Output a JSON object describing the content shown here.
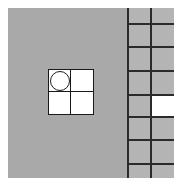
{
  "board": {
    "background": "#a9a9a9",
    "panel_background": "#b4b4b4",
    "line_color": "#2a2a2a"
  },
  "active_piece": {
    "cells": [
      {
        "row": 0,
        "col": 0,
        "has_circle": true
      },
      {
        "row": 0,
        "col": 1,
        "has_circle": false
      },
      {
        "row": 1,
        "col": 0,
        "has_circle": false
      },
      {
        "row": 1,
        "col": 1,
        "has_circle": false
      }
    ]
  },
  "side_grid": {
    "columns": 2,
    "rows": 7,
    "filled_cells": [
      {
        "row": 3,
        "col": 1
      }
    ]
  }
}
